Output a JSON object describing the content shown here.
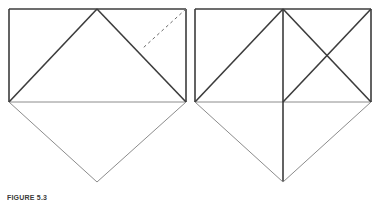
{
  "page": {
    "width": 383,
    "height": 201,
    "background": "#ffffff",
    "kind": "geometry-figure-pair"
  },
  "style": {
    "stroke_dark": "#3c3c3c",
    "stroke_light": "#8c8c8c",
    "stroke_medium": "#6b6b6b",
    "stroke_width_heavy": 1.6,
    "stroke_width_light": 1,
    "dash_pattern": "3 3"
  },
  "caption": {
    "label": "FIGURE 5.3",
    "text": "",
    "visible": true,
    "clipped": true
  },
  "figures": [
    {
      "id": "left-figure",
      "name": "figure-left",
      "rect": {
        "x": 9,
        "y": 9,
        "width": 177,
        "height": 93
      },
      "apex_top": {
        "x": 97,
        "y": 9
      },
      "apex_bottom": {
        "x": 97,
        "y": 182
      },
      "segments": [
        {
          "name": "rect-top-edge",
          "x1": 9,
          "y1": 9,
          "x2": 186,
          "y2": 9,
          "weight": "heavy",
          "dashed": false
        },
        {
          "name": "rect-left-edge",
          "x1": 9,
          "y1": 9,
          "x2": 9,
          "y2": 102,
          "weight": "heavy",
          "dashed": false
        },
        {
          "name": "rect-right-edge",
          "x1": 186,
          "y1": 9,
          "x2": 186,
          "y2": 102,
          "weight": "heavy",
          "dashed": false
        },
        {
          "name": "rect-bottom-edge",
          "x1": 9,
          "y1": 102,
          "x2": 186,
          "y2": 102,
          "weight": "light",
          "dashed": false
        },
        {
          "name": "triangle-left-side",
          "x1": 9,
          "y1": 102,
          "x2": 97,
          "y2": 9,
          "weight": "heavy",
          "dashed": false
        },
        {
          "name": "triangle-right-side",
          "x1": 97,
          "y1": 9,
          "x2": 186,
          "y2": 102,
          "weight": "heavy",
          "dashed": false
        },
        {
          "name": "lower-left-side",
          "x1": 9,
          "y1": 102,
          "x2": 97,
          "y2": 182,
          "weight": "light",
          "dashed": false
        },
        {
          "name": "lower-right-side",
          "x1": 97,
          "y1": 182,
          "x2": 186,
          "y2": 102,
          "weight": "light",
          "dashed": false
        },
        {
          "name": "fold-crease-dashed",
          "x1": 186,
          "y1": 9,
          "x2": 143,
          "y2": 48,
          "weight": "light",
          "dashed": true
        }
      ]
    },
    {
      "id": "right-figure",
      "name": "figure-right",
      "rect": {
        "x": 195,
        "y": 9,
        "width": 176,
        "height": 93
      },
      "apex_top": {
        "x": 283,
        "y": 9
      },
      "apex_bottom": {
        "x": 283,
        "y": 182
      },
      "segments": [
        {
          "name": "rect-top-edge",
          "x1": 195,
          "y1": 9,
          "x2": 371,
          "y2": 9,
          "weight": "heavy",
          "dashed": false
        },
        {
          "name": "rect-left-edge",
          "x1": 195,
          "y1": 9,
          "x2": 195,
          "y2": 102,
          "weight": "heavy",
          "dashed": false
        },
        {
          "name": "rect-right-edge",
          "x1": 371,
          "y1": 9,
          "x2": 371,
          "y2": 102,
          "weight": "heavy",
          "dashed": false
        },
        {
          "name": "rect-bottom-edge",
          "x1": 195,
          "y1": 102,
          "x2": 371,
          "y2": 102,
          "weight": "light",
          "dashed": false
        },
        {
          "name": "triangle-left-side",
          "x1": 195,
          "y1": 102,
          "x2": 283,
          "y2": 9,
          "weight": "heavy",
          "dashed": false
        },
        {
          "name": "triangle-right-side",
          "x1": 283,
          "y1": 9,
          "x2": 371,
          "y2": 102,
          "weight": "heavy",
          "dashed": false
        },
        {
          "name": "center-vertical-axis",
          "x1": 283,
          "y1": 9,
          "x2": 283,
          "y2": 182,
          "weight": "heavy",
          "dashed": false
        },
        {
          "name": "quadrant-diagonal-down",
          "x1": 283,
          "y1": 102,
          "x2": 371,
          "y2": 9,
          "weight": "heavy",
          "dashed": false
        },
        {
          "name": "lower-left-side",
          "x1": 195,
          "y1": 102,
          "x2": 283,
          "y2": 182,
          "weight": "light",
          "dashed": false
        },
        {
          "name": "lower-right-side",
          "x1": 283,
          "y1": 182,
          "x2": 371,
          "y2": 102,
          "weight": "light",
          "dashed": false
        }
      ]
    }
  ]
}
